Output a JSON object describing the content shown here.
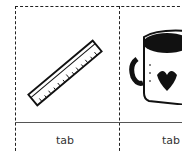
{
  "cards": [
    {
      "image": "ruler-icon",
      "label": "tab"
    },
    {
      "image": "mug-icon",
      "label": "tab"
    }
  ]
}
